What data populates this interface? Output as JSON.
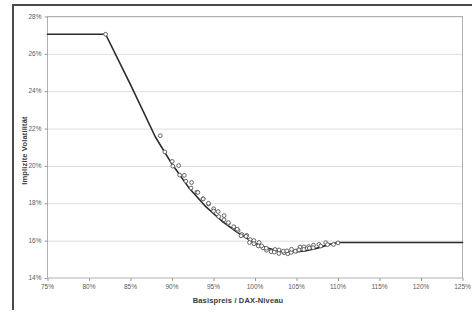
{
  "figure": {
    "background_color": "#ffffff",
    "frame_color": "#4a4a4a",
    "plot_border_color": "#b0b0b0",
    "gridline_color": "#dedede",
    "line_color": "#2b2b2b",
    "marker_edge_color": "#555555",
    "marker_fill_color": "#ffffff"
  },
  "chart_data": {
    "type": "scatter",
    "title": "",
    "subtitle": "",
    "xlabel": "Basispreis / DAX-Niveau",
    "ylabel": "Implizite Volatilität",
    "xlim": [
      75,
      125
    ],
    "ylim": [
      14,
      28
    ],
    "xticks": [
      75,
      80,
      85,
      90,
      95,
      100,
      105,
      110,
      115,
      120,
      125
    ],
    "yticks": [
      14,
      16,
      18,
      20,
      22,
      24,
      26,
      28
    ],
    "xtick_labels": [
      "75%",
      "80%",
      "85%",
      "90%",
      "95%",
      "100%",
      "105%",
      "110%",
      "115%",
      "120%",
      "125%"
    ],
    "ytick_labels": [
      "14%",
      "16%",
      "18%",
      "20%",
      "22%",
      "24%",
      "26%",
      "28%"
    ],
    "grid": "horizontal",
    "legend": "none",
    "series": [
      {
        "name": "Volatilitäts-Smile (Fit)",
        "type": "line",
        "x": [
          75.0,
          82.0,
          85.0,
          88.0,
          90.0,
          92.0,
          94.0,
          96.0,
          98.0,
          100.0,
          101.5,
          103.0,
          104.5,
          106.0,
          107.5,
          109.0,
          110.0,
          115.0,
          120.0,
          125.0
        ],
        "y": [
          27.05,
          27.05,
          24.35,
          21.55,
          20.1,
          18.85,
          17.85,
          17.05,
          16.4,
          15.85,
          15.6,
          15.42,
          15.38,
          15.45,
          15.6,
          15.8,
          15.9,
          15.9,
          15.9,
          15.9
        ]
      },
      {
        "name": "Beobachtete implizite Volatilitäten",
        "type": "scatter",
        "x": [
          82.0,
          88.4,
          89.3,
          89.9,
          90.2,
          90.6,
          91.1,
          91.4,
          91.8,
          92.2,
          92.5,
          92.9,
          93.2,
          93.6,
          93.9,
          94.2,
          94.5,
          94.9,
          95.2,
          95.5,
          95.8,
          96.1,
          96.4,
          96.7,
          97.0,
          97.3,
          97.5,
          97.8,
          98.0,
          98.3,
          98.5,
          98.8,
          99.0,
          99.3,
          99.5,
          99.8,
          100.0,
          100.3,
          100.5,
          100.8,
          101.0,
          101.3,
          101.5,
          101.8,
          102.0,
          102.3,
          102.5,
          102.8,
          103.0,
          103.3,
          103.5,
          103.8,
          104.0,
          104.3,
          104.5,
          104.8,
          105.0,
          105.3,
          105.5,
          105.8,
          106.0,
          106.3,
          106.6,
          106.9,
          107.2,
          107.6,
          108.0,
          108.4,
          108.9,
          109.4,
          110.0
        ],
        "y": [
          27.05,
          21.7,
          20.65,
          20.3,
          20.1,
          19.95,
          19.6,
          19.45,
          19.25,
          19.0,
          18.85,
          18.7,
          18.5,
          18.3,
          18.2,
          18.05,
          17.9,
          17.75,
          17.65,
          17.5,
          17.4,
          17.25,
          17.15,
          17.0,
          16.9,
          16.8,
          16.7,
          16.6,
          16.5,
          16.4,
          16.35,
          16.25,
          16.15,
          16.1,
          16.0,
          15.95,
          15.9,
          15.8,
          15.75,
          15.7,
          15.65,
          15.6,
          15.55,
          15.5,
          15.5,
          15.45,
          15.42,
          15.4,
          15.38,
          15.4,
          15.38,
          15.4,
          15.42,
          15.45,
          15.45,
          15.5,
          15.5,
          15.55,
          15.55,
          15.6,
          15.62,
          15.65,
          15.68,
          15.7,
          15.72,
          15.75,
          15.78,
          15.8,
          15.82,
          15.85,
          15.88
        ]
      }
    ]
  }
}
